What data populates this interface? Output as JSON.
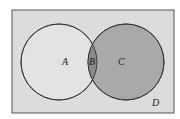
{
  "diagram": {
    "type": "venn",
    "universe": {
      "label": "D",
      "x": 12,
      "y": 10,
      "width": 162,
      "height": 103,
      "fill": "#dcdcdc",
      "stroke": "#444444"
    },
    "circles": [
      {
        "name": "left",
        "cx": 59,
        "cy": 62,
        "r": 38,
        "fill": "#e3e3e3"
      },
      {
        "name": "right",
        "cx": 126,
        "cy": 62,
        "r": 38,
        "fill": "#a9a9a9"
      }
    ],
    "intersection_fill": "#8a8a8a",
    "regions": [
      {
        "label": "A",
        "x": 64,
        "y": 65
      },
      {
        "label": "B",
        "x": 93,
        "y": 65
      },
      {
        "label": "C",
        "x": 121,
        "y": 65
      },
      {
        "label": "D",
        "x": 155,
        "y": 104
      }
    ]
  }
}
